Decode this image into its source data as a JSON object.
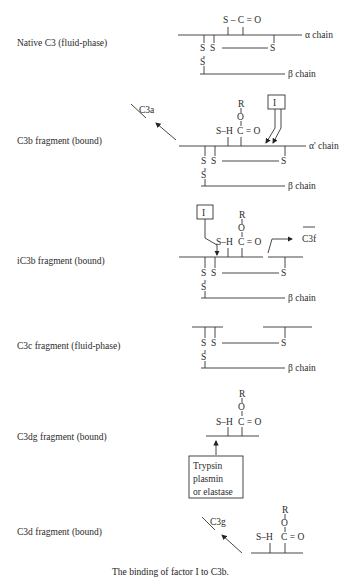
{
  "caption": "The binding of factor I to C3b.",
  "rows": [
    {
      "label": "Native C3 (fluid-phase)",
      "alpha": "α chain",
      "beta": "β chain"
    },
    {
      "label": "C3b fragment (bound)",
      "alpha": "α' chain",
      "beta": "β chain",
      "released": "C3a",
      "enzyme": "I"
    },
    {
      "label": "iC3b fragment (bound)",
      "beta": "β chain",
      "released": "C3f",
      "enzyme": "I"
    },
    {
      "label": "C3c fragment (fluid-phase)",
      "beta": "β chain"
    },
    {
      "label": "C3dg fragment (bound)",
      "enzyme_box": [
        "Trypsin",
        "plasmin",
        "or elastase"
      ]
    },
    {
      "label": "C3d fragment (bound)",
      "released": "C3g"
    }
  ],
  "chem": {
    "thioester": "S – C = O",
    "sh": "S–H",
    "co": "C = O",
    "R": "R",
    "O": "O",
    "S": "S"
  }
}
